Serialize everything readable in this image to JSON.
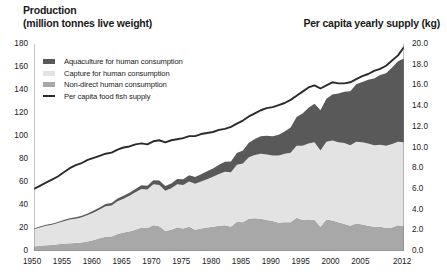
{
  "header": {
    "left_title": "Production",
    "left_subtitle": "(million tonnes live weight)",
    "right_title": "Per capita yearly supply (kg)"
  },
  "colors": {
    "aquaculture": "#595959",
    "capture": "#e3e3e3",
    "nondirect": "#a8a8a8",
    "line": "#2b2b2b",
    "axis": "#808080",
    "text": "#1a1a1a"
  },
  "legend": {
    "items": [
      {
        "label": "Aquaculture for human consumption",
        "type": "swatch",
        "color": "#595959"
      },
      {
        "label": "Capture for human consumption",
        "type": "swatch",
        "color": "#e3e3e3"
      },
      {
        "label": "Non-direct human consumption",
        "type": "swatch",
        "color": "#a8a8a8"
      },
      {
        "label": "Per capita food fish supply",
        "type": "line",
        "color": "#2b2b2b"
      }
    ]
  },
  "chart_data": {
    "type": "area",
    "title": "Production (million tonnes live weight)",
    "xlabel": "",
    "ylabel": "Production (million tonnes live weight)",
    "y2label": "Per capita yearly supply (kg)",
    "ylim": [
      0,
      180
    ],
    "y2lim": [
      0,
      20
    ],
    "xlim": [
      1950,
      2012
    ],
    "grid": false,
    "legend_position": "upper-left-inside",
    "yticks": [
      0,
      20,
      40,
      60,
      80,
      100,
      120,
      140,
      160,
      180
    ],
    "ytick_labels": [
      "0",
      "20",
      "40",
      "60",
      "80",
      "100",
      "120",
      "140",
      "160",
      "180"
    ],
    "y2ticks": [
      0,
      2,
      4,
      6,
      8,
      10,
      12,
      14,
      16,
      18,
      20
    ],
    "y2tick_labels": [
      "0.0",
      "2.0",
      "4.0",
      "6.0",
      "8.0",
      "10.0",
      "12.0",
      "14.0",
      "16.0",
      "18.0",
      "20.0"
    ],
    "xticks": [
      1950,
      1955,
      1960,
      1965,
      1970,
      1975,
      1980,
      1985,
      1990,
      1995,
      2000,
      2005,
      2012
    ],
    "xtick_labels": [
      "1950",
      "1955",
      "1960",
      "1965",
      "1970",
      "1975",
      "1980",
      "1985",
      "1990",
      "1995",
      "2000",
      "2005",
      "2012"
    ],
    "x": [
      1950,
      1951,
      1952,
      1953,
      1954,
      1955,
      1956,
      1957,
      1958,
      1959,
      1960,
      1961,
      1962,
      1963,
      1964,
      1965,
      1966,
      1967,
      1968,
      1969,
      1970,
      1971,
      1972,
      1973,
      1974,
      1975,
      1976,
      1977,
      1978,
      1979,
      1980,
      1981,
      1982,
      1983,
      1984,
      1985,
      1986,
      1987,
      1988,
      1989,
      1990,
      1991,
      1992,
      1993,
      1994,
      1995,
      1996,
      1997,
      1998,
      1999,
      2000,
      2001,
      2002,
      2003,
      2004,
      2005,
      2006,
      2007,
      2008,
      2009,
      2010,
      2011,
      2012
    ],
    "stack_order": [
      "nondirect",
      "capture",
      "aquaculture"
    ],
    "series": [
      {
        "name": "Non-direct human consumption",
        "key": "nondirect",
        "color": "#a8a8a8",
        "values": [
          4.0,
          4.5,
          5.0,
          5.3,
          5.8,
          6.3,
          6.8,
          7.0,
          7.3,
          8.2,
          9.5,
          11.0,
          12.4,
          12.6,
          14.8,
          16.0,
          17.0,
          18.5,
          20.5,
          20.0,
          22.5,
          21.5,
          17.5,
          18.5,
          20.5,
          19.5,
          21.0,
          18.5,
          19.5,
          20.5,
          21.0,
          22.0,
          22.5,
          21.0,
          25.5,
          25.0,
          28.0,
          28.5,
          28.0,
          27.0,
          26.0,
          24.5,
          25.0,
          25.0,
          29.0,
          27.0,
          27.5,
          27.0,
          21.0,
          27.5,
          26.5,
          25.0,
          23.5,
          22.0,
          24.0,
          23.0,
          22.0,
          21.0,
          21.0,
          20.0,
          20.5,
          22.5,
          21.5
        ]
      },
      {
        "name": "Capture for human consumption",
        "key": "capture",
        "color": "#e3e3e3",
        "values": [
          15.0,
          16.0,
          17.0,
          17.5,
          18.5,
          19.5,
          20.5,
          21.0,
          22.0,
          23.0,
          24.0,
          25.0,
          26.5,
          27.0,
          28.5,
          29.5,
          31.0,
          32.5,
          33.5,
          33.5,
          35.5,
          36.0,
          35.0,
          36.0,
          37.5,
          38.0,
          39.5,
          40.0,
          41.0,
          42.0,
          43.5,
          45.0,
          46.5,
          47.5,
          49.5,
          51.0,
          53.5,
          55.0,
          56.5,
          57.0,
          57.0,
          58.5,
          59.5,
          60.5,
          62.5,
          64.5,
          66.0,
          67.5,
          66.5,
          67.5,
          69.5,
          69.5,
          70.5,
          70.0,
          71.0,
          71.5,
          71.5,
          71.0,
          71.5,
          71.5,
          72.5,
          72.5,
          73.0
        ]
      },
      {
        "name": "Aquaculture for human consumption",
        "key": "aquaculture",
        "color": "#595959",
        "values": [
          0.6,
          0.7,
          0.8,
          0.9,
          1.0,
          1.1,
          1.2,
          1.3,
          1.4,
          1.5,
          1.7,
          1.8,
          2.0,
          2.1,
          2.3,
          2.5,
          2.7,
          2.9,
          3.1,
          3.3,
          3.5,
          3.7,
          4.0,
          4.3,
          4.6,
          5.0,
          5.4,
          5.8,
          6.3,
          6.8,
          7.3,
          7.9,
          8.6,
          9.3,
          10.2,
          11.4,
          12.6,
          14.0,
          15.3,
          16.2,
          16.8,
          18.0,
          19.5,
          22.0,
          25.0,
          28.0,
          31.0,
          33.5,
          35.0,
          37.5,
          40.0,
          42.5,
          44.5,
          47.0,
          50.0,
          52.5,
          55.5,
          58.0,
          60.5,
          63.0,
          66.5,
          70.0,
          73.0
        ]
      }
    ],
    "line_series": {
      "name": "Per capita food fish supply",
      "color": "#2b2b2b",
      "axis": "right",
      "unit": "kg",
      "values": [
        6.0,
        6.3,
        6.6,
        6.9,
        7.2,
        7.6,
        8.0,
        8.3,
        8.5,
        8.8,
        9.0,
        9.2,
        9.4,
        9.5,
        9.8,
        10.0,
        10.1,
        10.3,
        10.4,
        10.3,
        10.6,
        10.7,
        10.5,
        10.7,
        10.8,
        10.9,
        11.1,
        11.1,
        11.3,
        11.4,
        11.5,
        11.7,
        11.8,
        12.0,
        12.3,
        12.6,
        13.0,
        13.3,
        13.6,
        13.8,
        13.9,
        14.1,
        14.3,
        14.6,
        15.0,
        15.4,
        15.8,
        16.0,
        15.7,
        16.0,
        16.3,
        16.2,
        16.2,
        16.3,
        16.6,
        16.9,
        17.1,
        17.4,
        17.6,
        17.9,
        18.4,
        18.9,
        19.7
      ]
    }
  }
}
